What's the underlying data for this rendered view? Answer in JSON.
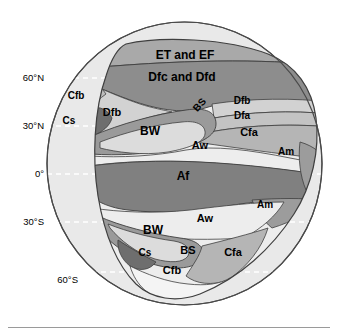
{
  "figure": {
    "width": 338,
    "height": 335
  },
  "globe": {
    "ocean_color": "#e9e9e9",
    "outline_color": "#4a4a4a",
    "center_x": 184.5,
    "center_y": 163.5,
    "radius_x": 137.5,
    "radius_y": 141.5
  },
  "latitude_labels": [
    {
      "text": "60°N",
      "x": 42,
      "y": 78
    },
    {
      "text": "30°N",
      "x": 42,
      "y": 126
    },
    {
      "text": "0°",
      "x": 42,
      "y": 174
    },
    {
      "text": "30°S",
      "x": 42,
      "y": 222
    },
    {
      "text": "60°S",
      "x": 42,
      "y": 272
    }
  ],
  "latitude_lines": [
    {
      "name": "60N",
      "y": 78
    },
    {
      "name": "30N",
      "y": 126
    },
    {
      "name": "equator",
      "y": 174
    },
    {
      "name": "30S",
      "y": 222
    },
    {
      "name": "60S",
      "y": 272
    }
  ],
  "palette": {
    "ocean": "#e9e9e9",
    "et_ef": "#a9a9a9",
    "dfc_dfd": "#8d8d8d",
    "dfb": "#d2d2d2",
    "dfa": "#c3c3c3",
    "cfb_north": "#bdbdbd",
    "cs": "#6e6e6e",
    "bw": "#dcdcdc",
    "bs": "#9a9a9a",
    "aw": "#ededed",
    "af": "#808080",
    "am": "#9c9c9c",
    "cfa": "#b5b5b5",
    "cfb_south": "#f4f4f4",
    "outline": "#3f3f3f",
    "label_text": "#000000",
    "grid_line": "#ffffff",
    "footer_rule": "#9a9a9a"
  },
  "climate_zones": [
    {
      "code": "ET and EF",
      "name": "polar-tundra-and-icecap",
      "label_x": 185,
      "label_y": 59,
      "font_size": 12,
      "rotate": 0,
      "fill_key": "et_ef"
    },
    {
      "code": "Dfc and Dfd",
      "name": "subarctic-continental",
      "label_x": 182,
      "label_y": 81,
      "font_size": 12,
      "rotate": 0,
      "fill_key": "dfc_dfd"
    },
    {
      "code": "Cfb",
      "name": "marine-west-coast-north",
      "label_x": 76,
      "label_y": 99,
      "font_size": 10,
      "rotate": 0,
      "fill_key": "cfb_north"
    },
    {
      "code": "Dfb",
      "name": "humid-continental-warm-summer-west",
      "label_x": 112,
      "label_y": 116,
      "font_size": 11,
      "rotate": 0,
      "fill_key": "dfb"
    },
    {
      "code": "Cs",
      "name": "mediterranean-north",
      "label_x": 69,
      "label_y": 124,
      "font_size": 10,
      "rotate": 0,
      "fill_key": "cs"
    },
    {
      "code": "BS",
      "name": "steppe-north",
      "label_x": 202,
      "label_y": 107,
      "font_size": 10,
      "rotate": -48,
      "fill_key": "bs"
    },
    {
      "code": "Dfb",
      "name": "humid-continental-warm-summer-east",
      "label_x": 242,
      "label_y": 104,
      "font_size": 10,
      "rotate": 0,
      "fill_key": "dfb"
    },
    {
      "code": "Dfa",
      "name": "humid-continental-hot-summer",
      "label_x": 242,
      "label_y": 119,
      "font_size": 10,
      "rotate": 0,
      "fill_key": "dfa"
    },
    {
      "code": "BW",
      "name": "desert-north",
      "label_x": 150,
      "label_y": 135,
      "font_size": 12,
      "rotate": 0,
      "fill_key": "bw"
    },
    {
      "code": "Cfa",
      "name": "humid-subtropical-north",
      "label_x": 249,
      "label_y": 136,
      "font_size": 11,
      "rotate": 0,
      "fill_key": "cfa"
    },
    {
      "code": "Aw",
      "name": "tropical-savanna-north",
      "label_x": 200,
      "label_y": 149,
      "font_size": 11,
      "rotate": 0,
      "fill_key": "aw"
    },
    {
      "code": "Am",
      "name": "tropical-monsoon-north",
      "label_x": 286,
      "label_y": 155,
      "font_size": 10,
      "rotate": 0,
      "fill_key": "am"
    },
    {
      "code": "Af",
      "name": "tropical-rainforest",
      "label_x": 183,
      "label_y": 180,
      "font_size": 12,
      "rotate": 0,
      "fill_key": "af"
    },
    {
      "code": "Am",
      "name": "tropical-monsoon-south",
      "label_x": 265,
      "label_y": 208,
      "font_size": 10,
      "rotate": 0,
      "fill_key": "am"
    },
    {
      "code": "Aw",
      "name": "tropical-savanna-south",
      "label_x": 205,
      "label_y": 222,
      "font_size": 11,
      "rotate": 0,
      "fill_key": "aw"
    },
    {
      "code": "BW",
      "name": "desert-south",
      "label_x": 153,
      "label_y": 234,
      "font_size": 12,
      "rotate": 0,
      "fill_key": "bw"
    },
    {
      "code": "BS",
      "name": "steppe-south",
      "label_x": 188,
      "label_y": 254,
      "font_size": 11,
      "rotate": 0,
      "fill_key": "bs"
    },
    {
      "code": "Cs",
      "name": "mediterranean-south",
      "label_x": 145,
      "label_y": 256,
      "font_size": 10,
      "rotate": 0,
      "fill_key": "cs"
    },
    {
      "code": "Cfa",
      "name": "humid-subtropical-south",
      "label_x": 233,
      "label_y": 256,
      "font_size": 11,
      "rotate": 0,
      "fill_key": "cfa"
    },
    {
      "code": "Cfb",
      "name": "marine-west-coast-south",
      "label_x": 172,
      "label_y": 274,
      "font_size": 11,
      "rotate": 0,
      "fill_key": "cfb_south"
    }
  ]
}
